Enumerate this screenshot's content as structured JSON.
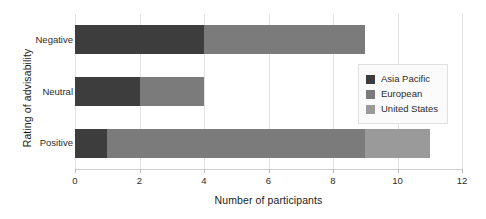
{
  "chart_data": {
    "type": "bar",
    "orientation": "horizontal",
    "stacked": true,
    "title": "",
    "xlabel": "Number of participants",
    "ylabel": "Rating of advisability",
    "categories": [
      "Negative",
      "Neutral",
      "Positive"
    ],
    "series": [
      {
        "name": "Asia Pacific",
        "color": "#3d3d3d",
        "values": [
          4,
          2,
          1
        ]
      },
      {
        "name": "European",
        "color": "#7b7b7b",
        "values": [
          5,
          2,
          8
        ]
      },
      {
        "name": "United States",
        "color": "#9a9a9a",
        "values": [
          0,
          0,
          2
        ]
      }
    ],
    "totals": [
      9,
      4,
      11
    ],
    "xlim": [
      0,
      12
    ],
    "xticks": [
      0,
      2,
      4,
      6,
      8,
      10,
      12
    ],
    "xticklabels": [
      "0",
      "2",
      "4",
      "6",
      "8",
      "10",
      "12"
    ],
    "grid": "vertical",
    "legend_position": "center-right",
    "background": "#ffffff"
  },
  "legend": {
    "items": [
      {
        "label": "Asia Pacific"
      },
      {
        "label": "European"
      },
      {
        "label": "United States"
      }
    ]
  }
}
